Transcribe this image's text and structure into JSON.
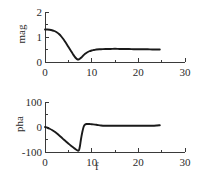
{
  "chart_data": [
    {
      "type": "line",
      "id": "magnitude-plot",
      "title": "",
      "xlabel": "",
      "ylabel": "mag",
      "xlim": [
        0,
        30
      ],
      "ylim": [
        0,
        2
      ],
      "xticks": [
        0,
        10,
        20,
        30
      ],
      "xticklabels": [
        "0",
        "10",
        "20",
        "30"
      ],
      "xminorticks": [
        5,
        15,
        25
      ],
      "yticks": [
        0,
        1,
        2
      ],
      "yticklabels": [
        "0",
        "1",
        "2"
      ],
      "grid": false,
      "legend": null,
      "x": [
        0.0,
        0.5,
        1.0,
        1.5,
        2.0,
        2.5,
        3.0,
        3.5,
        4.0,
        4.5,
        5.0,
        5.5,
        6.0,
        6.5,
        7.0,
        7.4,
        7.8,
        8.2,
        8.6,
        9.0,
        9.5,
        10.0,
        10.5,
        11.0,
        12.0,
        13.0,
        14.0,
        15.0,
        16.0,
        17.0,
        18.0,
        19.0,
        20.0,
        21.0,
        22.0,
        23.0,
        24.0,
        24.6
      ],
      "y": [
        1.3,
        1.3,
        1.29,
        1.27,
        1.24,
        1.19,
        1.12,
        1.02,
        0.9,
        0.76,
        0.61,
        0.46,
        0.31,
        0.18,
        0.1,
        0.12,
        0.18,
        0.26,
        0.33,
        0.38,
        0.43,
        0.46,
        0.48,
        0.5,
        0.51,
        0.52,
        0.52,
        0.53,
        0.52,
        0.52,
        0.52,
        0.51,
        0.51,
        0.51,
        0.51,
        0.5,
        0.5,
        0.5
      ]
    },
    {
      "type": "line",
      "id": "phase-plot",
      "title": "",
      "xlabel": "f",
      "ylabel": "pha",
      "xlim": [
        0,
        30
      ],
      "ylim": [
        -100,
        100
      ],
      "xticks": [
        0,
        10,
        20,
        30
      ],
      "xticklabels": [
        "0",
        "10",
        "20",
        "30"
      ],
      "xminorticks": [
        5,
        15,
        25
      ],
      "yticks": [
        -100,
        0,
        100
      ],
      "yticklabels": [
        "-100",
        "0",
        "100"
      ],
      "grid": false,
      "legend": null,
      "x": [
        0.0,
        0.5,
        1.0,
        1.5,
        2.0,
        2.5,
        3.0,
        3.5,
        4.0,
        4.5,
        5.0,
        5.5,
        6.0,
        6.5,
        6.9,
        7.1,
        7.3,
        7.5,
        7.7,
        8.0,
        8.3,
        8.6,
        9.0,
        9.5,
        10.0,
        11.0,
        12.0,
        13.0,
        14.0,
        15.0,
        16.0,
        17.0,
        18.0,
        19.0,
        20.0,
        21.0,
        22.0,
        23.0,
        24.0,
        24.6
      ],
      "y": [
        0.0,
        -3.0,
        -7.0,
        -12.0,
        -18.0,
        -25.0,
        -33.0,
        -41.0,
        -50.0,
        -58.0,
        -66.0,
        -74.0,
        -81.0,
        -88.0,
        -93.0,
        -95.0,
        -92.0,
        -75.0,
        -50.0,
        -20.0,
        2.0,
        10.0,
        12.0,
        12.0,
        11.0,
        9.0,
        6.0,
        5.0,
        5.0,
        5.0,
        5.0,
        5.0,
        5.0,
        5.0,
        5.0,
        5.0,
        5.0,
        5.0,
        6.0,
        7.0
      ]
    }
  ],
  "labels": {
    "mag_axis_title": "mag",
    "pha_axis_title": "pha",
    "x_axis_title": "f",
    "mag_y_0": "0",
    "mag_y_1": "1",
    "mag_y_2": "2",
    "mag_x_0": "0",
    "mag_x_10": "10",
    "mag_x_20": "20",
    "mag_x_30": "30",
    "pha_y_neg100": "-100",
    "pha_y_0": "0",
    "pha_y_100": "100",
    "pha_x_0": "0",
    "pha_x_10": "10",
    "pha_x_20": "20",
    "pha_x_30": "30"
  },
  "colors": {
    "curve": "#1a1a1a",
    "axis": "#3a3a3a",
    "text": "#2b2b2b",
    "background": "#ffffff"
  }
}
